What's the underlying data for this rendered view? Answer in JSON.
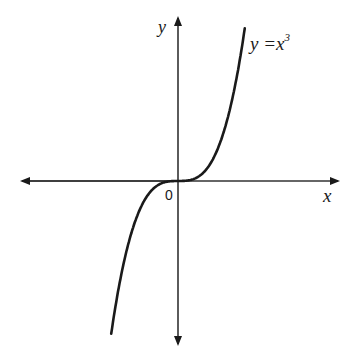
{
  "chart_data": {
    "type": "line",
    "title": "",
    "xlabel": "x",
    "ylabel": "y",
    "origin_label": "0",
    "series": [
      {
        "name": "y = x^3",
        "label": "y =x",
        "label_superscript": "3",
        "x": [
          -1.6,
          -1.4,
          -1.2,
          -1.0,
          -0.8,
          -0.6,
          -0.4,
          -0.2,
          0,
          0.2,
          0.4,
          0.6,
          0.8,
          1.0,
          1.2,
          1.4,
          1.6
        ],
        "values": [
          -4.096,
          -2.744,
          -1.728,
          -1.0,
          -0.512,
          -0.216,
          -0.064,
          -0.008,
          0,
          0.008,
          0.064,
          0.216,
          0.512,
          1.0,
          1.728,
          2.744,
          4.096
        ]
      }
    ],
    "grid": false,
    "axes_arrows": true,
    "ticks": false,
    "line_color": "#1a1a1a"
  },
  "labels": {
    "x_axis": "x",
    "y_axis": "y",
    "origin": "0",
    "curve": "y =x",
    "curve_exp": "3"
  }
}
